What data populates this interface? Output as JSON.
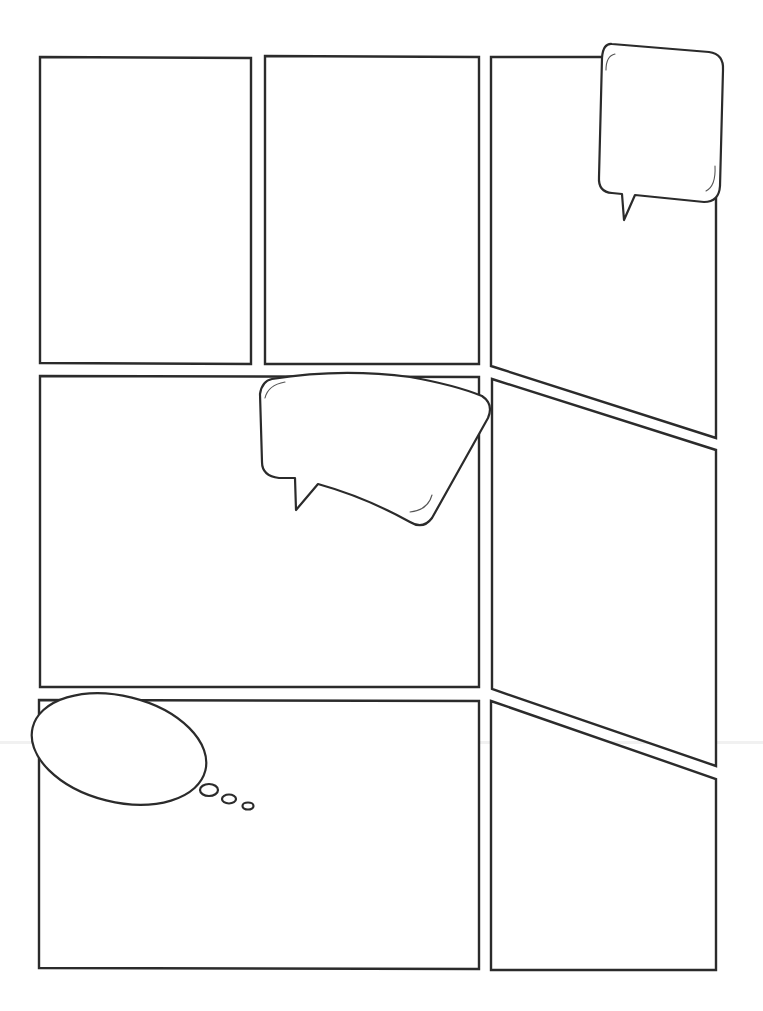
{
  "page": {
    "type": "blank comic page template",
    "background": "#ffffff",
    "line_color": "#2b2b2b"
  },
  "panels": [
    {
      "id": 1,
      "row": 1,
      "shape": "rectangle",
      "position": "top-left"
    },
    {
      "id": 2,
      "row": 1,
      "shape": "rectangle",
      "position": "top-middle"
    },
    {
      "id": 3,
      "row": 1,
      "shape": "trapezoid (slanted bottom)",
      "position": "top-right"
    },
    {
      "id": 4,
      "row": 2,
      "shape": "rectangle (wide)",
      "position": "middle-left"
    },
    {
      "id": 5,
      "row": 2,
      "shape": "parallelogram (slanted top and bottom)",
      "position": "middle-right"
    },
    {
      "id": 6,
      "row": 3,
      "shape": "rectangle (wide)",
      "position": "bottom-left"
    },
    {
      "id": 7,
      "row": 3,
      "shape": "trapezoid (slanted top)",
      "position": "bottom-right"
    }
  ],
  "balloons": [
    {
      "id": "speech-1",
      "kind": "speech",
      "text": "",
      "location": "top-right panel, upper right"
    },
    {
      "id": "speech-2",
      "kind": "speech",
      "text": "",
      "location": "middle-left panel, upper right (tilted)"
    },
    {
      "id": "thought-1",
      "kind": "thought",
      "text": "",
      "location": "bottom-left panel, upper left",
      "trail_bubbles": 3
    }
  ]
}
